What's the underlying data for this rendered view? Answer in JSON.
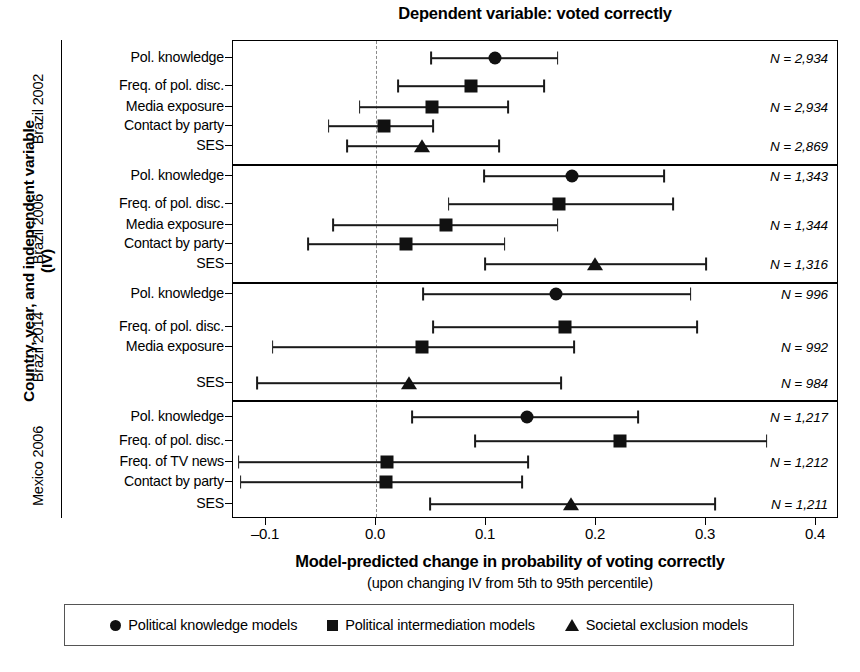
{
  "chart_data": {
    "type": "scatter",
    "title": "Dependent variable: voted correctly",
    "xlabel": "Model-predicted change in probability of voting correctly",
    "xsublabel": "(upon changing IV from 5th to 95th percentile)",
    "ylabel": "Country, year, and independent variable (IV)",
    "xlim": [
      -0.14,
      0.42
    ],
    "xticks": [
      -0.1,
      0.0,
      0.1,
      0.2,
      0.3,
      0.4
    ],
    "xticklabels": [
      "–0.1",
      "0.0",
      "0.1",
      "0.2",
      "0.3",
      "0.4"
    ],
    "grid": false,
    "zero_reference_line": 0.0,
    "legend_position": "bottom",
    "legend": [
      {
        "marker": "circle",
        "label": "Political knowledge models"
      },
      {
        "marker": "square",
        "label": "Political intermediation models"
      },
      {
        "marker": "triangle",
        "label": "Societal exclusion models"
      }
    ],
    "panels": [
      {
        "group": "Brazil 2002",
        "rows": [
          {
            "label": "Pol. knowledge",
            "marker": "circle",
            "estimate": 0.108,
            "ci_low": 0.05,
            "ci_high": 0.165,
            "n": "N = 2,934"
          },
          {
            "label": "Freq. of pol. disc.",
            "marker": "square",
            "estimate": 0.086,
            "ci_low": 0.02,
            "ci_high": 0.153,
            "n": ""
          },
          {
            "label": "Media exposure",
            "marker": "square",
            "estimate": 0.051,
            "ci_low": -0.015,
            "ci_high": 0.12,
            "n": "N = 2,934"
          },
          {
            "label": "Contact by party",
            "marker": "square",
            "estimate": 0.007,
            "ci_low": -0.043,
            "ci_high": 0.052,
            "n": ""
          },
          {
            "label": "SES",
            "marker": "triangle",
            "estimate": 0.042,
            "ci_low": -0.026,
            "ci_high": 0.112,
            "n": "N = 2,869"
          }
        ]
      },
      {
        "group": "Brazil 2006",
        "rows": [
          {
            "label": "Pol. knowledge",
            "marker": "circle",
            "estimate": 0.178,
            "ci_low": 0.098,
            "ci_high": 0.262,
            "n": "N = 1,343"
          },
          {
            "label": "Freq. of pol. disc.",
            "marker": "square",
            "estimate": 0.166,
            "ci_low": 0.066,
            "ci_high": 0.27,
            "n": ""
          },
          {
            "label": "Media exposure",
            "marker": "square",
            "estimate": 0.064,
            "ci_low": -0.039,
            "ci_high": 0.165,
            "n": "N = 1,344"
          },
          {
            "label": "Contact by party",
            "marker": "square",
            "estimate": 0.027,
            "ci_low": -0.062,
            "ci_high": 0.117,
            "n": ""
          },
          {
            "label": "SES",
            "marker": "triangle",
            "estimate": 0.199,
            "ci_low": 0.099,
            "ci_high": 0.3,
            "n": "N = 1,316"
          }
        ]
      },
      {
        "group": "Brazil 2014",
        "rows": [
          {
            "label": "Pol. knowledge",
            "marker": "circle",
            "estimate": 0.164,
            "ci_low": 0.043,
            "ci_high": 0.286,
            "n": "N = 996"
          },
          {
            "label": "Freq. of pol. disc.",
            "marker": "square",
            "estimate": 0.172,
            "ci_low": 0.052,
            "ci_high": 0.292,
            "n": ""
          },
          {
            "label": "Media exposure",
            "marker": "square",
            "estimate": 0.042,
            "ci_low": -0.094,
            "ci_high": 0.18,
            "n": "N = 992"
          },
          {
            "label": "SES",
            "marker": "triangle",
            "estimate": 0.03,
            "ci_low": -0.108,
            "ci_high": 0.168,
            "n": "N = 984"
          }
        ]
      },
      {
        "group": "Mexico 2006",
        "rows": [
          {
            "label": "Pol. knowledge",
            "marker": "circle",
            "estimate": 0.137,
            "ci_low": 0.033,
            "ci_high": 0.238,
            "n": "N = 1,217"
          },
          {
            "label": "Freq. of pol. disc.",
            "marker": "square",
            "estimate": 0.222,
            "ci_low": 0.09,
            "ci_high": 0.355,
            "n": ""
          },
          {
            "label": "Freq. of TV news",
            "marker": "square",
            "estimate": 0.01,
            "ci_low": -0.125,
            "ci_high": 0.138,
            "n": "N = 1,212"
          },
          {
            "label": "Contact by party",
            "marker": "square",
            "estimate": 0.009,
            "ci_low": -0.123,
            "ci_high": 0.133,
            "n": ""
          },
          {
            "label": "SES",
            "marker": "triangle",
            "estimate": 0.177,
            "ci_low": 0.049,
            "ci_high": 0.308,
            "n": "N = 1,211"
          }
        ]
      }
    ]
  }
}
